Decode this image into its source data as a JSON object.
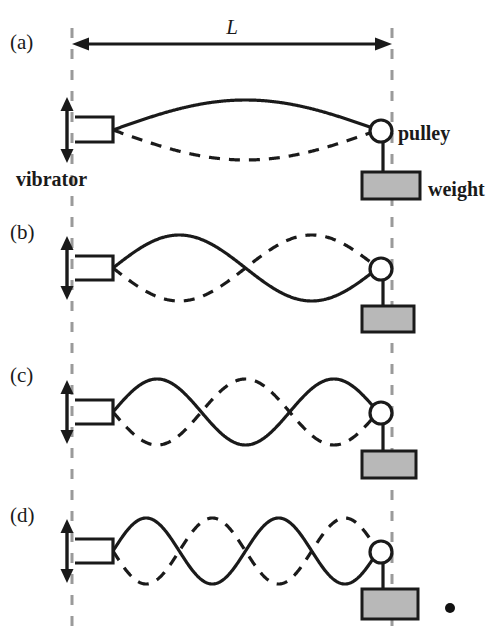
{
  "figure": {
    "background_color": "#ffffff",
    "ink_color": "#1a1a1a",
    "guide_color": "#9a9a9a",
    "weight_fill_color": "#b8b8b8",
    "pulley_fill_color": "#ffffff",
    "width": 497,
    "height": 626
  },
  "dimension": {
    "label": "L",
    "meaning": "length of vibrating string between vibrator and pulley",
    "arrow_style": "double-headed",
    "x_start": 72,
    "x_end": 392,
    "y": 44
  },
  "labels": {
    "vibrator": "vibrator",
    "pulley": "pulley",
    "weight": "weight"
  },
  "panels": [
    {
      "id": "a",
      "label": "(a)",
      "label_x": 10,
      "label_y": 49,
      "loops": 1,
      "harmonic": 1,
      "baseline_y": 130,
      "amplitude": 30,
      "wave_x_start": 113,
      "wave_x_end": 378,
      "vibrator": {
        "x": 75,
        "y_top": 117,
        "y_bottom": 142,
        "arrow_top": 97,
        "arrow_bottom": 163
      },
      "pulley": {
        "cx": 381,
        "cy": 131,
        "r": 11
      },
      "weight": {
        "x": 362,
        "y": 172,
        "w": 58,
        "h": 27
      },
      "hanger": {
        "x": 383,
        "y_top": 142,
        "y_bottom": 172
      },
      "shows_callouts": true
    },
    {
      "id": "b",
      "label": "(b)",
      "label_x": 10,
      "label_y": 239,
      "loops": 2,
      "harmonic": 2,
      "baseline_y": 268,
      "amplitude": 33,
      "wave_x_start": 113,
      "wave_x_end": 378,
      "vibrator": {
        "x": 75,
        "y_top": 256,
        "y_bottom": 280,
        "arrow_top": 236,
        "arrow_bottom": 300
      },
      "pulley": {
        "cx": 381,
        "cy": 269,
        "r": 11
      },
      "weight": {
        "x": 362,
        "y": 306,
        "w": 52,
        "h": 26
      },
      "hanger": {
        "x": 383,
        "y_top": 280,
        "y_bottom": 306
      },
      "shows_callouts": false
    },
    {
      "id": "c",
      "label": "(c)",
      "label_x": 10,
      "label_y": 382,
      "loops": 3,
      "harmonic": 3,
      "baseline_y": 412,
      "amplitude": 33,
      "wave_x_start": 113,
      "wave_x_end": 378,
      "vibrator": {
        "x": 75,
        "y_top": 400,
        "y_bottom": 424,
        "arrow_top": 380,
        "arrow_bottom": 444
      },
      "pulley": {
        "cx": 381,
        "cy": 413,
        "r": 11
      },
      "weight": {
        "x": 362,
        "y": 451,
        "w": 54,
        "h": 27
      },
      "hanger": {
        "x": 383,
        "y_top": 424,
        "y_bottom": 451
      },
      "shows_callouts": false
    },
    {
      "id": "d",
      "label": "(d)",
      "label_x": 10,
      "label_y": 522,
      "loops": 4,
      "harmonic": 4,
      "baseline_y": 551,
      "amplitude": 33,
      "wave_x_start": 113,
      "wave_x_end": 378,
      "vibrator": {
        "x": 75,
        "y_top": 539,
        "y_bottom": 563,
        "arrow_top": 519,
        "arrow_bottom": 583
      },
      "pulley": {
        "cx": 381,
        "cy": 552,
        "r": 11
      },
      "weight": {
        "x": 362,
        "y": 589,
        "w": 56,
        "h": 30
      },
      "hanger": {
        "x": 383,
        "y_top": 563,
        "y_bottom": 589
      },
      "shows_callouts": false
    }
  ],
  "guides": [
    {
      "name": "left-guide",
      "x": 72,
      "y_top": 28,
      "y_bottom": 626
    },
    {
      "name": "right-guide",
      "x": 392,
      "y_top": 28,
      "y_bottom": 626
    }
  ],
  "marker_dot": {
    "cx": 450,
    "cy": 608,
    "r": 5
  },
  "callouts": {
    "vibrator": {
      "x": 16,
      "y": 186
    },
    "pulley": {
      "x": 398,
      "y": 140
    },
    "weight": {
      "x": 428,
      "y": 196
    }
  }
}
